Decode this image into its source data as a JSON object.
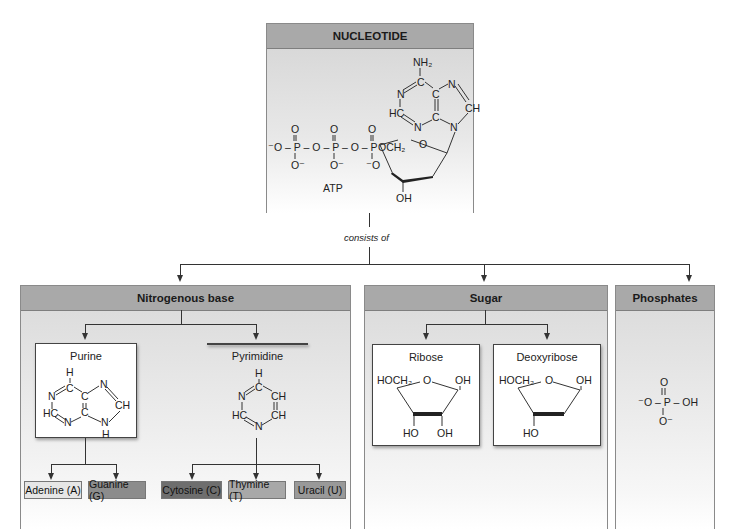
{
  "nucleotide": {
    "title": "NUCLEOTIDE",
    "molecule_label": "ATP",
    "atoms": {
      "nh2": "NH₂",
      "n1": "N",
      "c_top": "C",
      "n_right": "N",
      "ch": "CH",
      "hc": "HC",
      "c_mid": "C",
      "n_bot": "N",
      "n9": "N",
      "c_mid2": "C",
      "o_ring": "O",
      "och2": "OCH₂",
      "oh": "OH",
      "phosphate_chain": "⁻O – P – O – P – O – P",
      "p_top_o": "O",
      "p_bottom1": "O⁻",
      "p_bottom2": "O⁻",
      "p_bottom3": "⁻O"
    }
  },
  "connector_label": "consists of",
  "panels": {
    "nitrogenous_base": {
      "title": "Nitrogenous base",
      "purine": {
        "title": "Purine"
      },
      "pyrimidine": {
        "title": "Pyrimidine"
      },
      "bases": [
        {
          "label": "Adenine (A)",
          "color": "#e6e6e6"
        },
        {
          "label": "Guanine (G)",
          "color": "#8c8c8c"
        },
        {
          "label": "Cytosine (C)",
          "color": "#6e6e6e"
        },
        {
          "label": "Thymine (T)",
          "color": "#a8a8a8"
        },
        {
          "label": "Uracil (U)",
          "color": "#999999"
        }
      ]
    },
    "sugar": {
      "title": "Sugar",
      "ribose": {
        "title": "Ribose",
        "hoch2": "HOCH₂",
        "o": "O",
        "oh1": "OH",
        "ho": "HO",
        "oh2": "OH"
      },
      "deoxyribose": {
        "title": "Deoxyribose",
        "hoch2": "HOCH₂",
        "o": "O",
        "oh1": "OH",
        "ho": "HO"
      }
    },
    "phosphates": {
      "title": "Phosphates",
      "o_top": "O",
      "left": "⁻O – P – OH",
      "o_bottom": "O⁻"
    }
  },
  "colors": {
    "header_bg": "#a9a9a9",
    "panel_border": "#8a8a8a",
    "line": "#333333"
  }
}
